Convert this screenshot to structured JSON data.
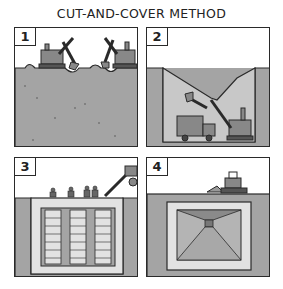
{
  "title": "CUT-AND-COVER METHOD",
  "colors": {
    "ink": "#2a2a2a",
    "ground": "#a4a4a4",
    "ground_light": "#c8c8c8",
    "box_light": "#e2e2e2",
    "sky": "#ffffff"
  },
  "panels": [
    {
      "number": "1",
      "caption": "Excavators begin digging at ground surface"
    },
    {
      "number": "2",
      "caption": "Trench excavated, truck and excavator at bottom"
    },
    {
      "number": "3",
      "caption": "Workers build reinforced structure in trench"
    },
    {
      "number": "4",
      "caption": "Tunnel covered, bulldozer restores surface"
    }
  ]
}
